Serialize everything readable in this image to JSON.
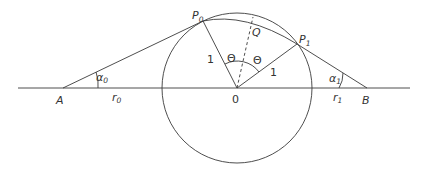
{
  "diagram": {
    "points": {
      "A": {
        "label": "A",
        "x": 63,
        "y": 88
      },
      "B": {
        "label": "B",
        "x": 367,
        "y": 88
      },
      "O": {
        "label": "0",
        "x": 237,
        "y": 88
      },
      "P0": {
        "label": "P",
        "sub": "0",
        "x": 203,
        "y": 21
      },
      "P1": {
        "label": "P",
        "sub": "1",
        "x": 297,
        "y": 44
      },
      "Q": {
        "label": "Q",
        "x": 224,
        "y": 21
      }
    },
    "circle": {
      "cx": 237,
      "cy": 88,
      "r": 75
    },
    "labels": {
      "radius_left": "1",
      "radius_right": "1",
      "theta_left": "Θ",
      "theta_right": "Θ",
      "alpha0": {
        "main": "α",
        "sub": "0"
      },
      "alpha1": {
        "main": "α",
        "sub": "1"
      },
      "r0": {
        "main": "r",
        "sub": "0"
      },
      "r1": {
        "main": "r",
        "sub": "1"
      }
    }
  }
}
